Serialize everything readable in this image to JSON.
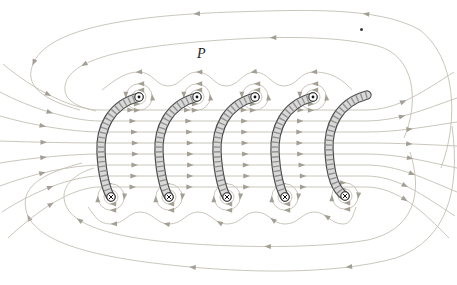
{
  "figure": {
    "type": "physics-field-diagram"
  },
  "canvas": {
    "width": 457,
    "height": 285,
    "background": "#ffffff"
  },
  "colors": {
    "field_line": "#c3bfb4",
    "arrow": "#a39f94",
    "tube_outline": "#4d4d4d",
    "tube_fill": "#d9d9d9",
    "tube_hatch": "#929292",
    "symbol_ring": "#2a2a2a",
    "symbol_fill": "#ffffff",
    "symbol_mark": "#111111",
    "label": "#1c1c1c"
  },
  "labels": {
    "field_point": "P",
    "stray_dot": "dot-artifact"
  },
  "coils": [
    {
      "top": [
        139,
        97
      ],
      "bottom": [
        111,
        197
      ],
      "top_symbol": "current-out",
      "bottom_symbol": "current-in"
    },
    {
      "top": [
        197,
        97
      ],
      "bottom": [
        169,
        197
      ],
      "top_symbol": "current-out",
      "bottom_symbol": "current-in"
    },
    {
      "top": [
        255,
        97
      ],
      "bottom": [
        227,
        197
      ],
      "top_symbol": "current-out",
      "bottom_symbol": "current-in"
    },
    {
      "top": [
        313,
        97
      ],
      "bottom": [
        285,
        197
      ],
      "top_symbol": "current-out",
      "bottom_symbol": "current-in"
    },
    {
      "top": [
        367,
        95
      ],
      "bottom": [
        345,
        196
      ],
      "top_symbol": "cut-end",
      "bottom_symbol": "current-in"
    }
  ],
  "field_lines": {
    "interior": [
      {
        "y": 110,
        "left": [
          3,
          64
        ],
        "right": [
          454,
          72
        ],
        "arrows": [
          0.12,
          0.3,
          0.42,
          0.54,
          0.66,
          0.88
        ]
      },
      {
        "y": 121,
        "left": [
          0,
          92
        ],
        "right": [
          457,
          98
        ],
        "arrows": [
          0.12,
          0.3,
          0.42,
          0.54,
          0.66,
          0.88
        ]
      },
      {
        "y": 132,
        "left": [
          0,
          116
        ],
        "right": [
          457,
          122
        ],
        "arrows": [
          0.1,
          0.3,
          0.42,
          0.54,
          0.66,
          0.9
        ]
      },
      {
        "y": 143,
        "left": [
          0,
          141
        ],
        "right": [
          457,
          146
        ],
        "arrows": [
          0.1,
          0.3,
          0.42,
          0.54,
          0.66,
          0.9
        ]
      },
      {
        "y": 154,
        "left": [
          0,
          163
        ],
        "right": [
          457,
          168
        ],
        "arrows": [
          0.1,
          0.3,
          0.42,
          0.54,
          0.66,
          0.9
        ]
      },
      {
        "y": 165,
        "left": [
          0,
          186
        ],
        "right": [
          457,
          192
        ],
        "arrows": [
          0.1,
          0.3,
          0.42,
          0.54,
          0.66,
          0.9
        ]
      },
      {
        "y": 176,
        "left": [
          2,
          212
        ],
        "right": [
          455,
          216
        ],
        "arrows": [
          0.12,
          0.3,
          0.42,
          0.54,
          0.66,
          0.88
        ]
      },
      {
        "y": 187,
        "left": [
          8,
          238
        ],
        "right": [
          449,
          238
        ],
        "arrows": [
          0.12,
          0.3,
          0.42,
          0.54,
          0.66,
          0.88
        ]
      }
    ],
    "outer_loops": [
      {
        "d": "M 441 168 C 459 120 456 58 420 30 C 378 6 300 10 232 12 C 150 15 52 24 34 62 C 22 86 44 100 80 110",
        "arrows": [
          0.33,
          0.6,
          0.88
        ]
      },
      {
        "d": "M 452 126 C 461 192 446 240 396 258 C 330 276 240 272 180 266 C 110 259 34 246 26 210 C 20 184 48 172 82 163",
        "arrows": [
          0.33,
          0.58,
          0.86
        ]
      },
      {
        "d": "M 404 138 C 420 100 414 56 378 46 C 330 34 260 37 208 41 C 148 46 76 54 66 82 C 60 100 78 107 96 111",
        "arrows": [
          0.45,
          0.85
        ]
      },
      {
        "d": "M 410 152 C 424 196 412 230 368 240 C 308 250 216 247 158 241 C 108 235 66 224 64 198 C 63 182 80 172 94 168",
        "arrows": [
          0.45,
          0.85
        ]
      }
    ],
    "wavy": [
      {
        "d": "M 352 90 C 338 74 324 72 313 72 C 300 72 297 86 284 86 C 272 86 268 72 255 72 C 242 72 239 86 226 86 C 214 86 211 72 197 72 C 184 72 181 86 168 86 C 156 86 153 72 139 72 C 126 72 116 79 102 90",
        "arrows": [
          0.16,
          0.4,
          0.62,
          0.86
        ]
      },
      {
        "d": "M 356 207 C 352 220 349 224 343 224 C 330 224 327 212 314 212 C 302 212 299 224 285 224 C 272 224 269 212 256 212 C 244 212 241 224 227 224 C 214 224 211 212 198 212 C 186 212 183 224 169 224 C 156 224 153 212 140 212 C 128 212 125 224 111 224 C 98 224 95 216 88 207",
        "arrows": [
          0.14,
          0.33,
          0.52,
          0.71,
          0.9
        ]
      }
    ],
    "wire_circles": {
      "inner_radius": 7,
      "outer_radius": 13.2,
      "inner_arrows": [
        0.25,
        0.75
      ],
      "outer_arrows": [
        0.02,
        0.25,
        0.5,
        0.75
      ],
      "top_direction": "counterclockwise",
      "bottom_direction": "clockwise"
    }
  }
}
